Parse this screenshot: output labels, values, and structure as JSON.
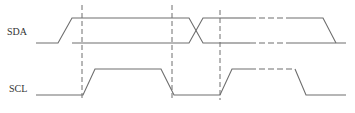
{
  "diagram": {
    "type": "timing-diagram",
    "colors": {
      "line": "#6e6e6e",
      "dash": "#6e6e6e",
      "background": "#ffffff",
      "text": "#333333"
    },
    "signals": [
      {
        "name": "SDA",
        "label_x": 7,
        "label_y": 27
      },
      {
        "name": "SCL",
        "label_x": 9,
        "label_y": 89
      }
    ],
    "sda": {
      "high_y": 18,
      "low_y": 43,
      "start": [
        [
          36,
          43
        ],
        [
          58,
          43
        ],
        [
          72,
          18
        ],
        [
          172,
          18
        ]
      ],
      "low_line": [
        [
          72,
          43
        ],
        [
          172,
          43
        ]
      ],
      "crossover": {
        "top_to_low": [
          [
            172,
            18
          ],
          [
            189,
            18
          ],
          [
            203,
            43
          ],
          [
            220,
            43
          ]
        ],
        "low_to_top": [
          [
            172,
            43
          ],
          [
            189,
            43
          ],
          [
            203,
            18
          ],
          [
            220,
            18
          ]
        ]
      },
      "after_top_solid": [
        [
          220,
          18
        ],
        [
          250,
          18
        ]
      ],
      "after_top_dashed": [
        [
          250,
          18
        ],
        [
          288,
          18
        ]
      ],
      "after_top_end": [
        [
          288,
          18
        ],
        [
          323,
          18
        ],
        [
          336,
          43
        ]
      ],
      "after_low_solid": [
        [
          220,
          43
        ],
        [
          250,
          43
        ]
      ],
      "after_low_dashed": [
        [
          250,
          43
        ],
        [
          288,
          43
        ]
      ],
      "after_low_end": [
        [
          288,
          43
        ],
        [
          346,
          43
        ]
      ]
    },
    "scl": {
      "high_y": 69,
      "low_y": 95,
      "segments_solid": [
        [
          [
            36,
            95
          ],
          [
            83,
            95
          ],
          [
            95,
            69
          ],
          [
            161,
            69
          ],
          [
            174,
            95
          ],
          [
            220,
            95
          ],
          [
            232,
            69
          ],
          [
            250,
            69
          ]
        ]
      ],
      "segments_dashed": [
        [
          [
            250,
            69
          ],
          [
            295,
            69
          ]
        ]
      ],
      "segments_end": [
        [
          [
            295,
            69
          ],
          [
            306,
            95
          ],
          [
            346,
            95
          ]
        ]
      ]
    },
    "dashed_markers": [
      {
        "x": 82,
        "y1": 5,
        "y2": 100
      },
      {
        "x": 172,
        "y1": 5,
        "y2": 100
      },
      {
        "x": 220,
        "y1": 10,
        "y2": 100
      }
    ]
  }
}
